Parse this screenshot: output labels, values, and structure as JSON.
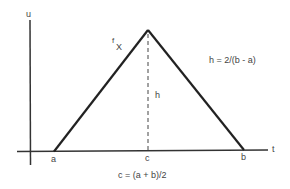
{
  "diagram": {
    "axes": {
      "vertical_label": "u",
      "horizontal_label": "t"
    },
    "function_label": {
      "main": "f",
      "subscript": "X"
    },
    "points": {
      "a": "a",
      "c": "c",
      "b": "b"
    },
    "height_label": "h",
    "height_formula": "h = 2/(b - a)",
    "midpoint_formula": "c = (a + b)/2",
    "colors": {
      "line": "#222222",
      "text": "#444444",
      "background": "#ffffff"
    }
  }
}
